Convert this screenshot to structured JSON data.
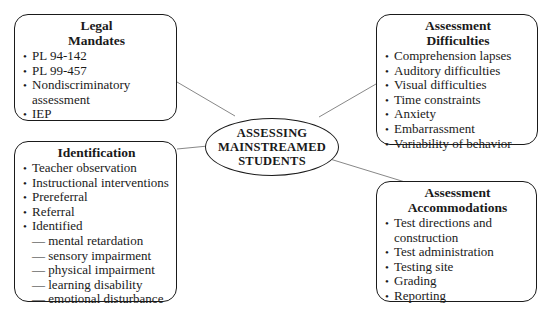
{
  "center": {
    "lines": [
      "ASSESSING",
      "MAINSTREAMED",
      "STUDENTS"
    ]
  },
  "legal_mandates": {
    "title_lines": [
      "Legal",
      "Mandates"
    ],
    "items": [
      {
        "text": "PL 94-142"
      },
      {
        "text": "PL 99-457"
      },
      {
        "text": "Nondiscriminatory",
        "cont": "assessment"
      },
      {
        "text": "IEP"
      }
    ]
  },
  "assessment_difficulties": {
    "title_lines": [
      "Assessment",
      "Difficulties"
    ],
    "items": [
      {
        "text": "Comprehension lapses"
      },
      {
        "text": "Auditory difficulties"
      },
      {
        "text": "Visual difficulties"
      },
      {
        "text": "Time constraints"
      },
      {
        "text": "Anxiety"
      },
      {
        "text": "Embarrassment"
      },
      {
        "text": "Variability of behavior"
      }
    ]
  },
  "identification": {
    "title": "Identification",
    "items": [
      {
        "text": "Teacher observation"
      },
      {
        "text": "Instructional interventions"
      },
      {
        "text": "Prereferral"
      },
      {
        "text": "Referral"
      },
      {
        "text": "Identified"
      }
    ],
    "sub_items": [
      {
        "text": "— mental retardation"
      },
      {
        "text": "— sensory impairment"
      },
      {
        "text": "— physical impairment"
      },
      {
        "text": "— learning disability"
      },
      {
        "text": "— emotional disturbance"
      }
    ]
  },
  "assessment_accommodations": {
    "title_lines": [
      "Assessment",
      "Accommodations"
    ],
    "items": [
      {
        "text": "Test directions and",
        "cont": "construction"
      },
      {
        "text": "Test administration"
      },
      {
        "text": "Testing site"
      },
      {
        "text": "Grading"
      },
      {
        "text": "Reporting"
      }
    ]
  },
  "colors": {
    "stroke": "#1a1a1a",
    "connector": "#888888",
    "background": "#ffffff"
  }
}
